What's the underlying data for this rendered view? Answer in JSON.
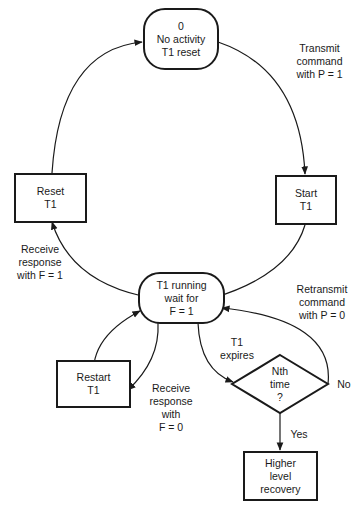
{
  "diagram": {
    "nodes": {
      "idle": {
        "label": "0\nNo activity\nT1 reset",
        "shape": "rounded"
      },
      "start": {
        "label": "Start\nT1",
        "shape": "rect"
      },
      "reset": {
        "label": "Reset\nT1",
        "shape": "rect"
      },
      "running": {
        "label": "T1 running\nwait for\nF = 1",
        "shape": "rounded"
      },
      "restart": {
        "label": "Restart\nT1",
        "shape": "rect"
      },
      "decision": {
        "label": "Nth\ntime\n?",
        "shape": "diamond"
      },
      "recovery": {
        "label": "Higher\nlevel\nrecovery",
        "shape": "rect"
      }
    },
    "edges": {
      "transmit": "Transmit\ncommand\nwith P = 1",
      "receive_f1": "Receive\nresponse\nwith F = 1",
      "retransmit": "Retransmit\ncommand\nwith P = 0",
      "expires": "T1\nexpires",
      "receive_f0": "Receive\nresponse\nwith\nF = 0",
      "no": "No",
      "yes": "Yes"
    },
    "stroke_color": "#1a1a1a"
  }
}
